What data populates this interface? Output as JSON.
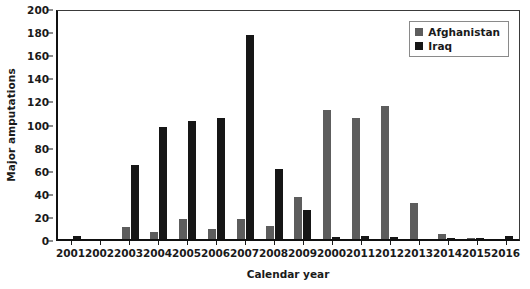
{
  "chart_data": {
    "type": "bar",
    "title": "",
    "xlabel": "Calendar year",
    "ylabel": "Major amputations",
    "ylim": [
      0,
      200
    ],
    "yticks": [
      0,
      20,
      40,
      60,
      80,
      100,
      120,
      140,
      160,
      180,
      200
    ],
    "grid": false,
    "legend_position": "top-right",
    "categories": [
      "2001",
      "2002",
      "2003",
      "2004",
      "2005",
      "2006",
      "2007",
      "2008",
      "2009",
      "2000",
      "2011",
      "2012",
      "2013",
      "2014",
      "2015",
      "2016"
    ],
    "series": [
      {
        "name": "Afghanistan",
        "color": "#5d5d5d",
        "values": [
          0,
          0,
          10,
          6,
          17,
          9,
          17,
          11,
          36,
          112,
          105,
          115,
          31,
          4,
          1,
          0
        ]
      },
      {
        "name": "Iraq",
        "color": "#161616",
        "values": [
          3,
          0,
          64,
          97,
          102,
          105,
          177,
          61,
          25,
          2,
          3,
          2,
          0,
          1,
          1,
          3
        ]
      }
    ]
  },
  "legend": {
    "items": [
      {
        "label": "Afghanistan",
        "color": "#5d5d5d"
      },
      {
        "label": "Iraq",
        "color": "#161616"
      }
    ]
  }
}
